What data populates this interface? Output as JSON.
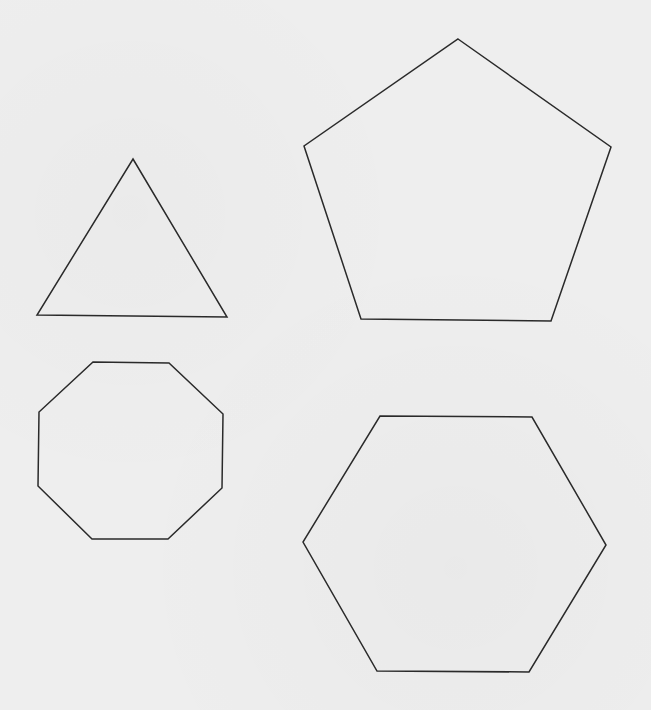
{
  "canvas": {
    "width": 651,
    "height": 710,
    "background": "#eeeeee",
    "stroke_color": "#2a2a2a",
    "stroke_width": 1.5
  },
  "shapes": [
    {
      "name": "triangle",
      "sides": 3,
      "points": "133,159 227,317 37,315"
    },
    {
      "name": "pentagon",
      "sides": 5,
      "points": "458,39 611,147 551,321 361,319 304,146"
    },
    {
      "name": "octagon",
      "sides": 8,
      "points": "93,362 169,363 223,414 222,488 168,539 92,539 38,486 39,412"
    },
    {
      "name": "hexagon",
      "sides": 6,
      "points": "380,416 532,417 606,545 529,672 377,671 303,542"
    }
  ]
}
